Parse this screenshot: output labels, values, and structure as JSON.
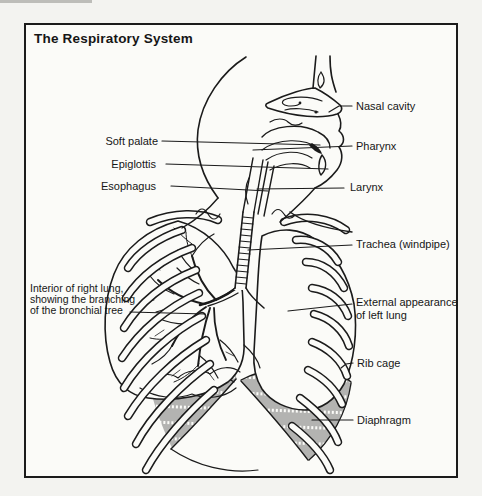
{
  "figure": {
    "title": "The Respiratory System",
    "labels": {
      "soft_palate": "Soft palate",
      "epiglottis": "Epiglottis",
      "esophagus": "Esophagus",
      "nasal_cavity": "Nasal cavity",
      "pharynx": "Pharynx",
      "larynx": "Larynx",
      "trachea": "Trachea (windpipe)",
      "external_line1": "External appearance",
      "external_line2": "of left lung",
      "interior_line1": "Interior of right lung,",
      "interior_line2": "showing the branching",
      "interior_line3": "of the bronchial tree",
      "rib_cage": "Rib cage",
      "diaphragm": "Diaphragm"
    },
    "colors": {
      "ink": "#1b1b1b",
      "paper": "#fbfbf8",
      "page_background": "#f3f3f0"
    }
  }
}
